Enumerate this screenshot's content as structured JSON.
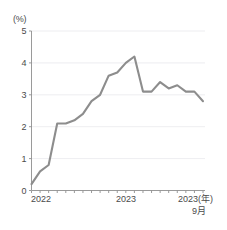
{
  "chart_data": {
    "type": "line",
    "title": "",
    "subtitle": "",
    "xlabel": "",
    "ylabel": "(%)",
    "unit_label": "(%)",
    "ylim": [
      0,
      5
    ],
    "ytick_labels": [
      "0",
      "1",
      "2",
      "3",
      "4",
      "5"
    ],
    "ytick_values": [
      0,
      1,
      2,
      3,
      4,
      5
    ],
    "xtick_labels": [
      "2022",
      "2023",
      "2023(年)"
    ],
    "xtick_sublabel": "9月",
    "grid": true,
    "legend": "none",
    "line_color": "#8d8d8d",
    "axis_color": "#8f8f8f",
    "grid_color": "#e9e9ec",
    "text_color": "#4a4a4a",
    "x": [
      "2022-01",
      "2022-02",
      "2022-03",
      "2022-04",
      "2022-05",
      "2022-06",
      "2022-07",
      "2022-08",
      "2022-09",
      "2022-10",
      "2022-11",
      "2022-12",
      "2023-01",
      "2023-02",
      "2023-03",
      "2023-04",
      "2023-05",
      "2023-06",
      "2023-07",
      "2023-08",
      "2023-09"
    ],
    "values": [
      0.2,
      0.6,
      0.8,
      2.1,
      2.1,
      2.2,
      2.4,
      2.8,
      3.0,
      3.6,
      3.7,
      4.0,
      4.2,
      3.1,
      3.1,
      3.4,
      3.2,
      3.3,
      3.1,
      3.1,
      2.8
    ],
    "series": [
      {
        "name": "消費者物価指数",
        "values": [
          0.2,
          0.6,
          0.8,
          2.1,
          2.1,
          2.2,
          2.4,
          2.8,
          3.0,
          3.6,
          3.7,
          4.0,
          4.2,
          3.1,
          3.1,
          3.4,
          3.2,
          3.3,
          3.1,
          3.1,
          2.8
        ]
      }
    ]
  }
}
